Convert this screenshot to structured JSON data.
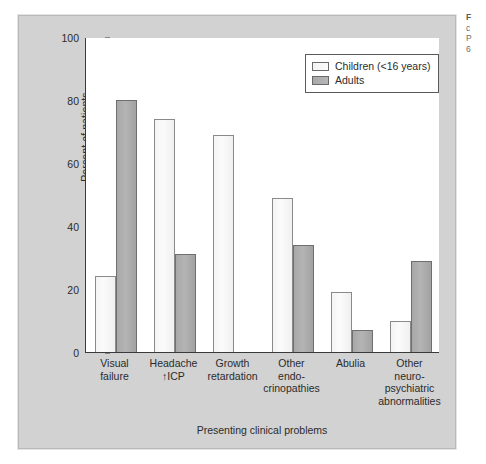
{
  "chart_data": {
    "type": "bar",
    "title": "",
    "xlabel": "Presenting clinical problems",
    "ylabel": "Percent of patients",
    "ylim": [
      0,
      100
    ],
    "yticks": [
      0,
      20,
      40,
      60,
      80,
      100
    ],
    "grid": false,
    "legend_position": "top-right",
    "categories": [
      "Visual failure",
      "Headache ↑ICP",
      "Growth retardation",
      "Other endo-crinopathies",
      "Abulia",
      "Other neuro-psychiatric abnormalities"
    ],
    "category_lines": [
      [
        "Visual",
        "failure"
      ],
      [
        "Headache",
        "↑ICP"
      ],
      [
        "Growth",
        "retardation"
      ],
      [
        "Other",
        "endo-",
        "crinopathies"
      ],
      [
        "Abulia"
      ],
      [
        "Other",
        "neuro-",
        "psychiatric",
        "abnormalities"
      ]
    ],
    "series": [
      {
        "name": "Children (<16 years)",
        "color": "#f7f7f7",
        "values": [
          24,
          74,
          69,
          49,
          19,
          10
        ]
      },
      {
        "name": "Adults",
        "color": "#b0b0b0",
        "values": [
          80,
          31,
          null,
          34,
          7,
          29
        ]
      }
    ]
  },
  "legend": {
    "items": [
      {
        "label": "Children (<16 years)",
        "swatch": "children"
      },
      {
        "label": "Adults",
        "swatch": "adults"
      }
    ]
  },
  "axes": {
    "y_title": "Percent of patients",
    "x_title": "Presenting clinical problems",
    "y_tick_labels": [
      "0",
      "20",
      "40",
      "60",
      "80",
      "100"
    ]
  },
  "caption": {
    "lines": [
      "F",
      "c",
      "P",
      "6"
    ]
  },
  "colors": {
    "figure_background": "#d2d2d2",
    "plot_background": "#ffffff",
    "axis": "#3a3a3a",
    "children_bar": "#f7f7f7",
    "adults_bar": "#b0b0b0",
    "text": "#2b2b2b"
  }
}
